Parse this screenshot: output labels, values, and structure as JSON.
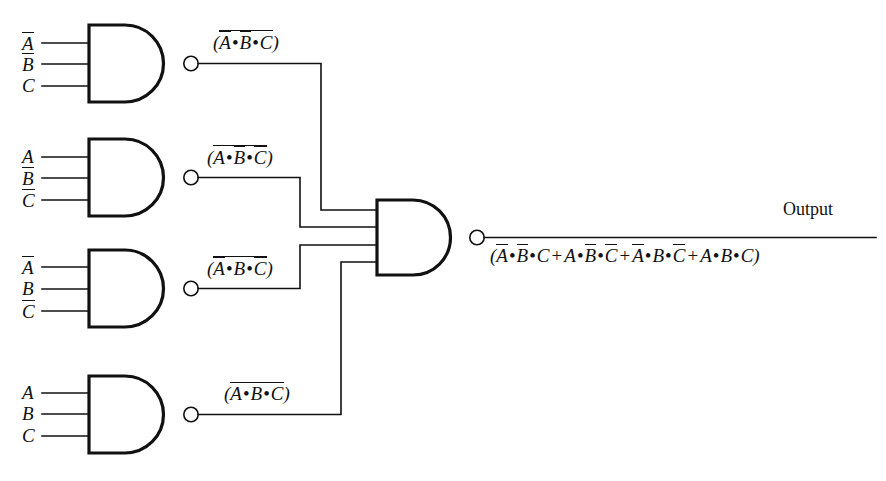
{
  "diagram": {
    "type": "logic-circuit",
    "background_color": "#ffffff",
    "line_color": "#111111",
    "gate_type": "NAND"
  },
  "gates": [
    {
      "id": "gate-1",
      "type": "NAND",
      "inputs": [
        {
          "label": "A",
          "overbar": true
        },
        {
          "label": "B",
          "overbar": true
        },
        {
          "label": "C",
          "overbar": false
        }
      ],
      "output_label": {
        "open_paren": "(",
        "terms": [
          {
            "letter": "A",
            "overbar": true
          },
          {
            "letter": "B",
            "overbar": true
          },
          {
            "letter": "C",
            "overbar": false
          }
        ],
        "close_paren": ")",
        "full_overbar": true,
        "plain_text": "(A̅ • B̅ • C)"
      }
    },
    {
      "id": "gate-2",
      "type": "NAND",
      "inputs": [
        {
          "label": "A",
          "overbar": false
        },
        {
          "label": "B",
          "overbar": true
        },
        {
          "label": "C",
          "overbar": true
        }
      ],
      "output_label": {
        "open_paren": "(",
        "terms": [
          {
            "letter": "A",
            "overbar": false
          },
          {
            "letter": "B",
            "overbar": true
          },
          {
            "letter": "C",
            "overbar": true
          }
        ],
        "close_paren": ")",
        "full_overbar": true,
        "plain_text": "(A • B̅ • C̅)"
      }
    },
    {
      "id": "gate-3",
      "type": "NAND",
      "inputs": [
        {
          "label": "A",
          "overbar": true
        },
        {
          "label": "B",
          "overbar": false
        },
        {
          "label": "C",
          "overbar": true
        }
      ],
      "output_label": {
        "open_paren": "(",
        "terms": [
          {
            "letter": "A",
            "overbar": true
          },
          {
            "letter": "B",
            "overbar": false
          },
          {
            "letter": "C",
            "overbar": true
          }
        ],
        "close_paren": ")",
        "full_overbar": true,
        "plain_text": "(A̅ • B • C̅)"
      }
    },
    {
      "id": "gate-4",
      "type": "NAND",
      "inputs": [
        {
          "label": "A",
          "overbar": false
        },
        {
          "label": "B",
          "overbar": false
        },
        {
          "label": "C",
          "overbar": false
        }
      ],
      "output_label": {
        "open_paren": "(",
        "terms": [
          {
            "letter": "A",
            "overbar": false
          },
          {
            "letter": "B",
            "overbar": false
          },
          {
            "letter": "C",
            "overbar": false
          }
        ],
        "close_paren": ")",
        "full_overbar": true,
        "plain_text": "(A • B • C)"
      }
    }
  ],
  "output_gate": {
    "id": "output-gate",
    "type": "NAND",
    "input_count": 4,
    "output_word": "Output",
    "expression": {
      "open_paren": "(",
      "close_paren": ")",
      "full_overbar": true,
      "products": [
        [
          {
            "letter": "A",
            "overbar": true
          },
          {
            "letter": "B",
            "overbar": true
          },
          {
            "letter": "C",
            "overbar": false
          }
        ],
        [
          {
            "letter": "A",
            "overbar": false
          },
          {
            "letter": "B",
            "overbar": true
          },
          {
            "letter": "C",
            "overbar": true
          }
        ],
        [
          {
            "letter": "A",
            "overbar": true
          },
          {
            "letter": "B",
            "overbar": false
          },
          {
            "letter": "C",
            "overbar": true
          }
        ],
        [
          {
            "letter": "A",
            "overbar": false
          },
          {
            "letter": "B",
            "overbar": false
          },
          {
            "letter": "C",
            "overbar": false
          }
        ]
      ],
      "operator_and": "•",
      "operator_or": "+",
      "plain_text": "(A̅ • B̅ • C + A • B̅ • C̅ + A̅ • B • C̅ + A • B • C)"
    }
  },
  "symbols": {
    "and_dot": "•",
    "or_plus": "+",
    "open_paren": "(",
    "close_paren": ")"
  }
}
